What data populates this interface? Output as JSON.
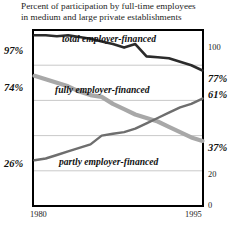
{
  "title": {
    "line1": "Percent of participation by full-time employees",
    "line2": "in medium and large private establishments"
  },
  "axes": {
    "left_labels": [
      {
        "text": "97%",
        "value": 97
      },
      {
        "text": "74%",
        "value": 74
      },
      {
        "text": "26%",
        "value": 26
      }
    ],
    "right_labels": [
      {
        "text": "100",
        "value": 100
      },
      {
        "text": "77%",
        "value": 77
      },
      {
        "text": "61%",
        "value": 61
      },
      {
        "text": "37%",
        "value": 37
      },
      {
        "text": "20",
        "value": 20
      },
      {
        "text": "0",
        "value": 0
      }
    ],
    "x_labels": [
      {
        "text": "1980",
        "value": 1980
      },
      {
        "text": "1995",
        "value": 1995
      }
    ]
  },
  "series_labels": {
    "total": "total employer-financed",
    "fully": "fully employer-financed",
    "partly": "partly employer-financed"
  },
  "colors": {
    "total_line": "#2b2b2b",
    "fully_line": "#a8a8a8",
    "partly_line": "#6e6e6e",
    "gridline": "#c9c9c9",
    "frame": "#000000",
    "background": "#ffffff",
    "text": "#1c1c1c"
  },
  "chart_data": {
    "type": "line",
    "title": "Percent of participation by full-time employees in medium and large private establishments",
    "xlabel": "",
    "ylabel": "",
    "xlim": [
      1980,
      1995
    ],
    "ylim": [
      0,
      100
    ],
    "grid": true,
    "gridlines": [
      0,
      20,
      40,
      60,
      80,
      100
    ],
    "legend": "inline-annotations",
    "x": [
      1980,
      1981,
      1982,
      1983,
      1984,
      1985,
      1986,
      1987,
      1988,
      1989,
      1990,
      1991,
      1992,
      1993,
      1994,
      1995
    ],
    "series": [
      {
        "name": "total employer-financed",
        "color": "#2b2b2b",
        "values": [
          97,
          97,
          96.5,
          97,
          96,
          95,
          93.5,
          92,
          90,
          92,
          85,
          84.5,
          84,
          82,
          80,
          77
        ],
        "endpoint_labels": {
          "start": "97%",
          "end": "77%"
        }
      },
      {
        "name": "fully employer-financed",
        "color": "#a8a8a8",
        "values": [
          74,
          72,
          70,
          68,
          65,
          63,
          62,
          58,
          55,
          52,
          50,
          48,
          45,
          42,
          39,
          37
        ],
        "endpoint_labels": {
          "start": "74%",
          "end": "37%"
        }
      },
      {
        "name": "partly employer-financed",
        "color": "#6e6e6e",
        "values": [
          26,
          27,
          29,
          31,
          33,
          35,
          40,
          41,
          42,
          44,
          47,
          50,
          53,
          56,
          58,
          61
        ],
        "endpoint_labels": {
          "start": "26%",
          "end": "61%"
        }
      }
    ]
  }
}
